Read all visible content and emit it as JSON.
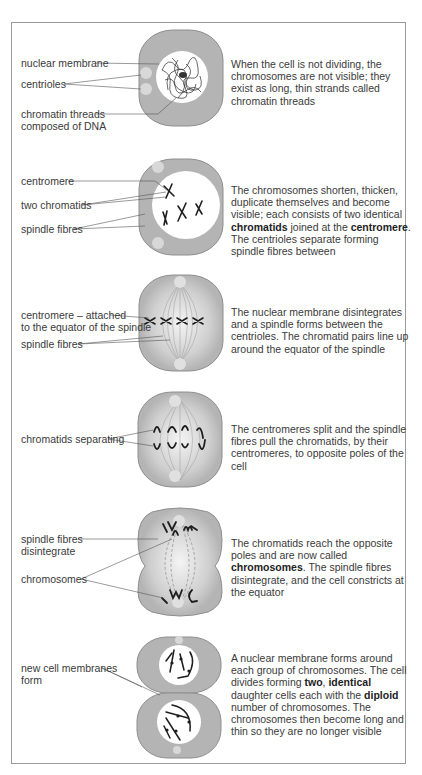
{
  "figure": {
    "stages": [
      {
        "id": "interphase",
        "labels": [
          "nuclear membrane",
          "centrioles",
          "chromatin threads\ncomposed of DNA"
        ],
        "description": [
          {
            "text": "When the cell is not dividing, the chromosomes are not visible; they exist as long, thin strands called chromatin threads",
            "bold": false
          }
        ]
      },
      {
        "id": "prophase",
        "labels": [
          "centromere",
          "two chromatids",
          "spindle fibres"
        ],
        "description": [
          {
            "text": "The chromosomes shorten, thicken, duplicate themselves and become visible; each consists of two identical ",
            "bold": false
          },
          {
            "text": "chromatids",
            "bold": true
          },
          {
            "text": " joined at the ",
            "bold": false
          },
          {
            "text": "centromere",
            "bold": true
          },
          {
            "text": ". The centrioles separate forming spindle fibres between",
            "bold": false
          }
        ]
      },
      {
        "id": "metaphase",
        "labels": [
          "centromere – attached\nto the equator of the spindle",
          "spindle fibres"
        ],
        "description": [
          {
            "text": "The nuclear membrane disintegrates and a spindle forms between the centrioles. The chromatid pairs line up around the equator of the spindle",
            "bold": false
          }
        ]
      },
      {
        "id": "anaphase",
        "labels": [
          "chromatids separating"
        ],
        "description": [
          {
            "text": "The centromeres split and the spindle fibres pull the chromatids, by their centromeres, to opposite poles of the cell",
            "bold": false
          }
        ]
      },
      {
        "id": "telophase",
        "labels": [
          "spindle fibres\ndisintegrate",
          "chromosomes"
        ],
        "description": [
          {
            "text": "The chromatids reach the opposite poles and are now called ",
            "bold": false
          },
          {
            "text": "chromosomes",
            "bold": true
          },
          {
            "text": ". The spindle fibres disintegrate, and the cell constricts at the equator",
            "bold": false
          }
        ]
      },
      {
        "id": "cytokinesis",
        "labels": [
          "new cell membranes\nform"
        ],
        "description": [
          {
            "text": "A nuclear membrane forms around each group of chromosomes. The cell divides forming ",
            "bold": false
          },
          {
            "text": "two",
            "bold": true
          },
          {
            "text": ", ",
            "bold": false
          },
          {
            "text": "identical",
            "bold": true
          },
          {
            "text": " daughter cells each with the ",
            "bold": false
          },
          {
            "text": "diploid",
            "bold": true
          },
          {
            "text": " number of chromosomes. The chromosomes then become long and thin so they are no longer visible",
            "bold": false
          }
        ]
      }
    ],
    "colors": {
      "cell_fill": "#b4b4b4",
      "cell_stroke": "#8a8a8a",
      "nucleus_fill": "#ffffff",
      "chromosome": "#1e1e1e",
      "leader_line": "#555555",
      "frame": "#9a9a9a"
    }
  }
}
